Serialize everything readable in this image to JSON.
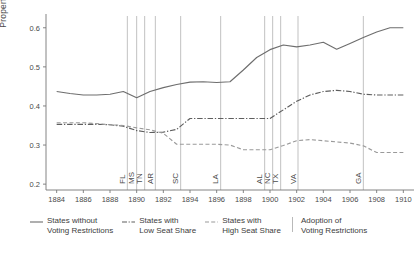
{
  "chart_data": {
    "type": "line",
    "title": "",
    "xlabel": "",
    "ylabel": "Property Tax Rate",
    "xlim": [
      1883.2,
      1910.8
    ],
    "ylim": [
      0.185,
      0.625
    ],
    "grid": false,
    "legend_position": "bottom",
    "x_ticks": [
      1884,
      1886,
      1888,
      1890,
      1892,
      1894,
      1896,
      1898,
      1900,
      1902,
      1904,
      1906,
      1908,
      1910
    ],
    "x_tick_labels": [
      "1884",
      "1886",
      "1888",
      "1890",
      "1892",
      "1894",
      "1896",
      "1898",
      "1900",
      "1902",
      "1904",
      "1906",
      "1908",
      "1910"
    ],
    "y_ticks": [
      0.2,
      0.3,
      0.4,
      0.5,
      0.6
    ],
    "y_tick_labels": [
      "0.2",
      "0.3",
      "0.4",
      "0.5",
      "0.6"
    ],
    "x": [
      1884,
      1885,
      1886,
      1887,
      1888,
      1889,
      1890,
      1891,
      1892,
      1893,
      1894,
      1895,
      1896,
      1897,
      1898,
      1899,
      1900,
      1901,
      1902,
      1903,
      1904,
      1905,
      1906,
      1907,
      1908,
      1909,
      1910
    ],
    "series": [
      {
        "name": "States without Voting Restrictions",
        "style": "solid",
        "color": "#6e6e6e",
        "values": [
          0.437,
          0.432,
          0.428,
          0.428,
          0.43,
          0.437,
          0.421,
          0.437,
          0.447,
          0.455,
          0.461,
          0.462,
          0.46,
          0.462,
          0.492,
          0.524,
          0.544,
          0.556,
          0.551,
          0.556,
          0.563,
          0.545,
          0.56,
          0.575,
          0.589,
          0.6,
          0.6
        ]
      },
      {
        "name": "States with Low Seat Share",
        "style": "dashdot",
        "color": "#5e5e5e",
        "values": [
          0.353,
          0.353,
          0.353,
          0.353,
          0.352,
          0.348,
          0.337,
          0.332,
          0.333,
          0.34,
          0.368,
          0.368,
          0.368,
          0.368,
          0.368,
          0.368,
          0.368,
          0.39,
          0.412,
          0.428,
          0.437,
          0.44,
          0.437,
          0.43,
          0.428,
          0.428,
          0.428
        ]
      },
      {
        "name": "States with High Seat Share",
        "style": "dashed",
        "color": "#9a9a9a",
        "values": [
          0.357,
          0.357,
          0.357,
          0.355,
          0.352,
          0.35,
          0.344,
          0.339,
          0.33,
          0.302,
          0.302,
          0.302,
          0.302,
          0.3,
          0.288,
          0.288,
          0.288,
          0.299,
          0.311,
          0.314,
          0.311,
          0.308,
          0.305,
          0.298,
          0.281,
          0.281,
          0.281
        ]
      }
    ],
    "event_lines": {
      "name": "Adoption of Voting Restrictions",
      "style": "solid-thin",
      "color": "#a8a8a8",
      "events": [
        {
          "state": "FL",
          "year": 1889.3
        },
        {
          "state": "MS",
          "year": 1890.0
        },
        {
          "state": "TN",
          "year": 1890.6
        },
        {
          "state": "AR",
          "year": 1891.4
        },
        {
          "state": "SC",
          "year": 1893.3
        },
        {
          "state": "LA",
          "year": 1896.3
        },
        {
          "state": "AL",
          "year": 1899.6
        },
        {
          "state": "NC",
          "year": 1900.2
        },
        {
          "state": "TX",
          "year": 1900.8
        },
        {
          "state": "VA",
          "year": 1902.1
        },
        {
          "state": "GA",
          "year": 1907.0
        }
      ]
    }
  },
  "legend": {
    "items": [
      {
        "label": "States without\nVoting Restrictions",
        "style": "solid",
        "color": "#6e6e6e"
      },
      {
        "label": "States with\nLow Seat Share",
        "style": "dashdot",
        "color": "#5e5e5e"
      },
      {
        "label": "States with\nHigh Seat Share",
        "style": "dashed",
        "color": "#9a9a9a"
      },
      {
        "label": "Adoption of\nVoting Restrictions",
        "style": "none",
        "color": "#a8a8a8"
      }
    ]
  }
}
